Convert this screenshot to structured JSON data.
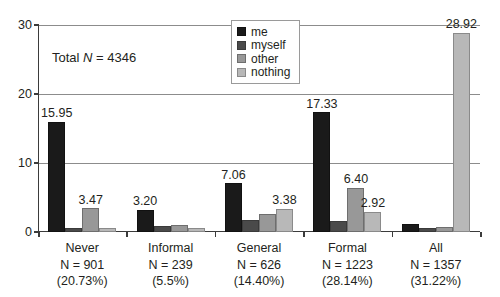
{
  "chart_data": {
    "type": "bar",
    "title": "",
    "subtitle": "",
    "xlabel": "",
    "ylabel": "",
    "ylim": [
      0,
      30
    ],
    "yticks": [
      0,
      10,
      20,
      30
    ],
    "grid": true,
    "legend_position": "top-right",
    "annotation": "Total N = 4346",
    "annotation_prefix": "Total ",
    "annotation_italic": "N",
    "annotation_suffix": " = 4346",
    "categories": [
      "Never",
      "Informal",
      "General",
      "Formal",
      "All"
    ],
    "category_detail": [
      {
        "name": "Never",
        "n_label": "N = 901",
        "pct_label": "(20.73%)"
      },
      {
        "name": "Informal",
        "n_label": "N = 239",
        "pct_label": "(5.5%)"
      },
      {
        "name": "General",
        "n_label": "N = 626",
        "pct_label": "(14.40%)"
      },
      {
        "name": "Formal",
        "n_label": "N = 1223",
        "pct_label": "(28.14%)"
      },
      {
        "name": "All",
        "n_label": "N = 1357",
        "pct_label": "(31.22%)"
      }
    ],
    "series": [
      {
        "name": "me",
        "color": "#1a1a1a",
        "values": [
          15.95,
          3.2,
          7.06,
          17.33,
          1.1
        ],
        "labels": [
          "15.95",
          "3.20",
          "7.06",
          "17.33",
          ""
        ]
      },
      {
        "name": "myself",
        "color": "#4a4a4a",
        "values": [
          0.6,
          0.85,
          1.8,
          1.55,
          0.55
        ],
        "labels": [
          "",
          "",
          "",
          "",
          ""
        ]
      },
      {
        "name": "other",
        "color": "#989898",
        "values": [
          3.47,
          0.95,
          2.55,
          6.4,
          0.7
        ],
        "labels": [
          "3.47",
          "",
          "",
          "6.40",
          ""
        ]
      },
      {
        "name": "nothing",
        "color": "#b8b8b8",
        "values": [
          0.65,
          0.6,
          3.38,
          2.92,
          28.92
        ],
        "labels": [
          "",
          "",
          "3.38",
          "2.92",
          "28.92"
        ]
      }
    ]
  },
  "legend": {
    "items": [
      {
        "label": "me"
      },
      {
        "label": "myself"
      },
      {
        "label": "other"
      },
      {
        "label": "nothing"
      }
    ]
  }
}
